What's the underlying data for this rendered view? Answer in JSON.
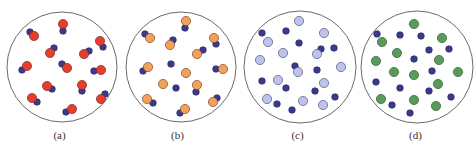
{
  "figure": {
    "panels": [
      {
        "id": "a",
        "caption": "(a)",
        "offset_x": 0,
        "center": [
          62,
          67
        ],
        "radius": 55,
        "colors": {
          "large": "#e53d2e",
          "large_stroke": "#7a2a25",
          "small": "#3a3a8c",
          "small_stroke": "#24245e"
        },
        "large": [
          [
            63,
            24
          ],
          [
            34,
            36
          ],
          [
            50,
            53
          ],
          [
            100,
            41
          ],
          [
            84,
            54
          ],
          [
            27,
            66
          ],
          [
            67,
            68
          ],
          [
            101,
            70
          ],
          [
            47,
            86
          ],
          [
            82,
            85
          ],
          [
            32,
            98
          ],
          [
            101,
            99
          ],
          [
            72,
            109
          ]
        ],
        "small": [
          [
            63,
            31
          ],
          [
            30,
            32
          ],
          [
            54,
            48
          ],
          [
            103,
            47
          ],
          [
            89,
            51
          ],
          [
            22,
            70
          ],
          [
            62,
            64
          ],
          [
            94,
            71
          ],
          [
            52,
            89
          ],
          [
            82,
            91
          ],
          [
            37,
            102
          ],
          [
            105,
            94
          ],
          [
            66,
            112
          ]
        ]
      },
      {
        "id": "b",
        "caption": "(b)",
        "offset_x": 118,
        "center": [
          63,
          67
        ],
        "radius": 55,
        "colors": {
          "large": "#f2a05a",
          "large_stroke": "#7a4a28",
          "small": "#3a3a8c",
          "small_stroke": "#24245e"
        },
        "large": [
          [
            68,
            21
          ],
          [
            32,
            38
          ],
          [
            52,
            45
          ],
          [
            96,
            38
          ],
          [
            79,
            54
          ],
          [
            30,
            67
          ],
          [
            68,
            73
          ],
          [
            105,
            69
          ],
          [
            45,
            84
          ],
          [
            79,
            85
          ],
          [
            29,
            99
          ],
          [
            95,
            102
          ],
          [
            67,
            109
          ]
        ],
        "small": [
          [
            67,
            28
          ],
          [
            27,
            34
          ],
          [
            55,
            40
          ],
          [
            98,
            44
          ],
          [
            85,
            50
          ],
          [
            25,
            71
          ],
          [
            53,
            64
          ],
          [
            58,
            88
          ],
          [
            78,
            92
          ],
          [
            35,
            103
          ],
          [
            99,
            98
          ],
          [
            62,
            113
          ],
          [
            98,
            69
          ]
        ]
      },
      {
        "id": "c",
        "caption": "(c)",
        "offset_x": 238,
        "center": [
          62,
          67
        ],
        "radius": 56,
        "colors": {
          "large": "#bdc3ea",
          "large_stroke": "#55557a",
          "small": "#3a3a8c",
          "small_stroke": "#24245e"
        },
        "large": [
          [
            61,
            21
          ],
          [
            86,
            33
          ],
          [
            30,
            42
          ],
          [
            45,
            53
          ],
          [
            79,
            54
          ],
          [
            22,
            60
          ],
          [
            60,
            72
          ],
          [
            103,
            67
          ],
          [
            40,
            80
          ],
          [
            86,
            83
          ],
          [
            29,
            99
          ],
          [
            65,
            101
          ],
          [
            85,
            105
          ]
        ],
        "small": [
          [
            24,
            33
          ],
          [
            48,
            31
          ],
          [
            61,
            43
          ],
          [
            83,
            49
          ],
          [
            96,
            48
          ],
          [
            57,
            66
          ],
          [
            79,
            70
          ],
          [
            24,
            81
          ],
          [
            48,
            88
          ],
          [
            77,
            91
          ],
          [
            39,
            104
          ],
          [
            54,
            110
          ],
          [
            97,
            97
          ]
        ]
      },
      {
        "id": "d",
        "caption": "(d)",
        "offset_x": 356,
        "center": [
          61,
          67
        ],
        "radius": 56,
        "colors": {
          "large": "#5a9a5a",
          "large_stroke": "#2f5a2f",
          "small": "#3a3a8c",
          "small_stroke": "#24245e"
        },
        "large": [
          [
            58,
            24
          ],
          [
            26,
            42
          ],
          [
            86,
            38
          ],
          [
            41,
            53
          ],
          [
            20,
            61
          ],
          [
            83,
            60
          ],
          [
            38,
            72
          ],
          [
            58,
            75
          ],
          [
            102,
            72
          ],
          [
            82,
            84
          ],
          [
            25,
            99
          ],
          [
            58,
            100
          ],
          [
            80,
            106
          ]
        ],
        "small": [
          [
            21,
            34
          ],
          [
            44,
            35
          ],
          [
            65,
            36
          ],
          [
            73,
            50
          ],
          [
            93,
            49
          ],
          [
            58,
            59
          ],
          [
            76,
            71
          ],
          [
            20,
            82
          ],
          [
            44,
            88
          ],
          [
            73,
            91
          ],
          [
            36,
            105
          ],
          [
            54,
            113
          ],
          [
            95,
            97
          ]
        ]
      }
    ]
  }
}
